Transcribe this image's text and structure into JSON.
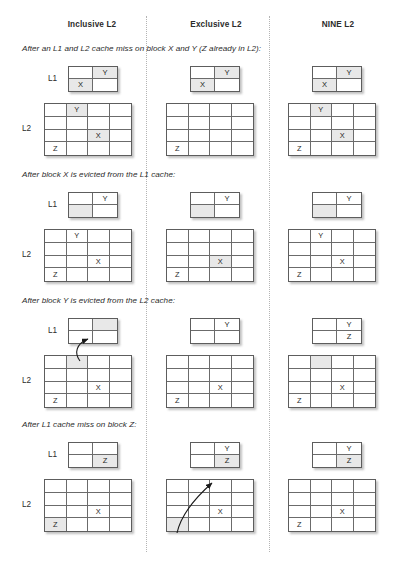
{
  "diagram": {
    "columns": [
      {
        "id": "inclusive",
        "label": "Inclusive L2"
      },
      {
        "id": "exclusive",
        "label": "Exclusive L2"
      },
      {
        "id": "nine",
        "label": "NINE L2"
      }
    ],
    "row_labels": {
      "l1": "L1",
      "l2": "L2"
    },
    "block_names": {
      "x": "X",
      "y": "Y",
      "z": "Z"
    },
    "shade_color": "#e8e8e8",
    "border_color": "#5d5d5d",
    "sections": [
      {
        "id": "section-1",
        "caption": "After an L1 and L2 cache miss on block X and Y (Z already in L2):",
        "cells": {
          "inclusive": {
            "l1": [
              [
                "",
                "Y"
              ],
              [
                "X",
                ""
              ]
            ],
            "l1_shaded": [
              [
                false,
                true
              ],
              [
                true,
                false
              ]
            ],
            "l2": [
              [
                "",
                "Y",
                "",
                ""
              ],
              [
                "",
                "",
                "",
                ""
              ],
              [
                "",
                "",
                "X",
                ""
              ],
              [
                "Z",
                "",
                "",
                ""
              ]
            ],
            "l2_shaded": [
              [
                false,
                true,
                false,
                false
              ],
              [
                false,
                false,
                false,
                false
              ],
              [
                false,
                false,
                true,
                false
              ],
              [
                false,
                false,
                false,
                false
              ]
            ]
          },
          "exclusive": {
            "l1": [
              [
                "",
                "Y"
              ],
              [
                "X",
                ""
              ]
            ],
            "l1_shaded": [
              [
                false,
                true
              ],
              [
                true,
                false
              ]
            ],
            "l2": [
              [
                "",
                "",
                "",
                ""
              ],
              [
                "",
                "",
                "",
                ""
              ],
              [
                "",
                "",
                "",
                ""
              ],
              [
                "Z",
                "",
                "",
                ""
              ]
            ],
            "l2_shaded": [
              [
                false,
                false,
                false,
                false
              ],
              [
                false,
                false,
                false,
                false
              ],
              [
                false,
                false,
                false,
                false
              ],
              [
                false,
                false,
                false,
                false
              ]
            ]
          },
          "nine": {
            "l1": [
              [
                "",
                "Y"
              ],
              [
                "X",
                ""
              ]
            ],
            "l1_shaded": [
              [
                false,
                true
              ],
              [
                true,
                false
              ]
            ],
            "l2": [
              [
                "",
                "Y",
                "",
                ""
              ],
              [
                "",
                "",
                "",
                ""
              ],
              [
                "",
                "",
                "X",
                ""
              ],
              [
                "Z",
                "",
                "",
                ""
              ]
            ],
            "l2_shaded": [
              [
                false,
                true,
                false,
                false
              ],
              [
                false,
                false,
                false,
                false
              ],
              [
                false,
                false,
                true,
                false
              ],
              [
                false,
                false,
                false,
                false
              ]
            ]
          }
        },
        "arrows": []
      },
      {
        "id": "section-2",
        "caption": "After block X is evicted from the L1 cache:",
        "cells": {
          "inclusive": {
            "l1": [
              [
                "",
                "Y"
              ],
              [
                "",
                ""
              ]
            ],
            "l1_shaded": [
              [
                false,
                false
              ],
              [
                true,
                false
              ]
            ],
            "l2": [
              [
                "",
                "Y",
                "",
                ""
              ],
              [
                "",
                "",
                "",
                ""
              ],
              [
                "",
                "",
                "X",
                ""
              ],
              [
                "Z",
                "",
                "",
                ""
              ]
            ],
            "l2_shaded": [
              [
                false,
                false,
                false,
                false
              ],
              [
                false,
                false,
                false,
                false
              ],
              [
                false,
                false,
                false,
                false
              ],
              [
                false,
                false,
                false,
                false
              ]
            ]
          },
          "exclusive": {
            "l1": [
              [
                "",
                "Y"
              ],
              [
                "",
                ""
              ]
            ],
            "l1_shaded": [
              [
                false,
                false
              ],
              [
                true,
                false
              ]
            ],
            "l2": [
              [
                "",
                "",
                "",
                ""
              ],
              [
                "",
                "",
                "",
                ""
              ],
              [
                "",
                "",
                "X",
                ""
              ],
              [
                "Z",
                "",
                "",
                ""
              ]
            ],
            "l2_shaded": [
              [
                false,
                false,
                false,
                false
              ],
              [
                false,
                false,
                false,
                false
              ],
              [
                false,
                false,
                true,
                false
              ],
              [
                false,
                false,
                false,
                false
              ]
            ]
          },
          "nine": {
            "l1": [
              [
                "",
                "Y"
              ],
              [
                "",
                ""
              ]
            ],
            "l1_shaded": [
              [
                false,
                false
              ],
              [
                true,
                false
              ]
            ],
            "l2": [
              [
                "",
                "Y",
                "",
                ""
              ],
              [
                "",
                "",
                "",
                ""
              ],
              [
                "",
                "",
                "X",
                ""
              ],
              [
                "Z",
                "",
                "",
                ""
              ]
            ],
            "l2_shaded": [
              [
                false,
                false,
                false,
                false
              ],
              [
                false,
                false,
                false,
                false
              ],
              [
                false,
                false,
                false,
                false
              ],
              [
                false,
                false,
                false,
                false
              ]
            ]
          }
        },
        "arrows": []
      },
      {
        "id": "section-3",
        "caption": "After block Y is evicted from the L2 cache:",
        "cells": {
          "inclusive": {
            "l1": [
              [
                "",
                ""
              ],
              [
                "",
                ""
              ]
            ],
            "l1_shaded": [
              [
                false,
                true
              ],
              [
                false,
                false
              ]
            ],
            "l2": [
              [
                "",
                "",
                "",
                ""
              ],
              [
                "",
                "",
                "",
                ""
              ],
              [
                "",
                "",
                "X",
                ""
              ],
              [
                "Z",
                "",
                "",
                ""
              ]
            ],
            "l2_shaded": [
              [
                false,
                true,
                false,
                false
              ],
              [
                false,
                false,
                false,
                false
              ],
              [
                false,
                false,
                false,
                false
              ],
              [
                false,
                false,
                false,
                false
              ]
            ]
          },
          "exclusive": {
            "l1": [
              [
                "",
                "Y"
              ],
              [
                "",
                ""
              ]
            ],
            "l1_shaded": [
              [
                false,
                false
              ],
              [
                false,
                false
              ]
            ],
            "l2": [
              [
                "",
                "",
                "",
                ""
              ],
              [
                "",
                "",
                "",
                ""
              ],
              [
                "",
                "",
                "X",
                ""
              ],
              [
                "Z",
                "",
                "",
                ""
              ]
            ],
            "l2_shaded": [
              [
                false,
                false,
                false,
                false
              ],
              [
                false,
                false,
                false,
                false
              ],
              [
                false,
                false,
                false,
                false
              ],
              [
                false,
                false,
                false,
                false
              ]
            ]
          },
          "nine": {
            "l1": [
              [
                "",
                "Y"
              ],
              [
                "",
                "Z"
              ]
            ],
            "l1_shaded": [
              [
                false,
                false
              ],
              [
                false,
                false
              ]
            ],
            "l2": [
              [
                "",
                "",
                "",
                ""
              ],
              [
                "",
                "",
                "",
                ""
              ],
              [
                "",
                "",
                "X",
                ""
              ],
              [
                "Z",
                "",
                "",
                ""
              ]
            ],
            "l2_shaded": [
              [
                false,
                true,
                false,
                false
              ],
              [
                false,
                false,
                false,
                false
              ],
              [
                false,
                false,
                false,
                false
              ],
              [
                false,
                false,
                false,
                false
              ]
            ]
          }
        },
        "arrows": [
          "inclusive-l2-to-l1"
        ]
      },
      {
        "id": "section-4",
        "caption": "After L1 cache miss on block Z:",
        "cells": {
          "inclusive": {
            "l1": [
              [
                "",
                ""
              ],
              [
                "",
                "Z"
              ]
            ],
            "l1_shaded": [
              [
                false,
                false
              ],
              [
                false,
                true
              ]
            ],
            "l2": [
              [
                "",
                "",
                "",
                ""
              ],
              [
                "",
                "",
                "",
                ""
              ],
              [
                "",
                "",
                "X",
                ""
              ],
              [
                "Z",
                "",
                "",
                ""
              ]
            ],
            "l2_shaded": [
              [
                false,
                false,
                false,
                false
              ],
              [
                false,
                false,
                false,
                false
              ],
              [
                false,
                false,
                false,
                false
              ],
              [
                true,
                false,
                false,
                false
              ]
            ]
          },
          "exclusive": {
            "l1": [
              [
                "",
                "Y"
              ],
              [
                "",
                "Z"
              ]
            ],
            "l1_shaded": [
              [
                false,
                false
              ],
              [
                false,
                true
              ]
            ],
            "l2": [
              [
                "",
                "",
                "",
                ""
              ],
              [
                "",
                "",
                "",
                ""
              ],
              [
                "",
                "",
                "X",
                ""
              ],
              [
                "",
                "",
                "",
                ""
              ]
            ],
            "l2_shaded": [
              [
                false,
                false,
                false,
                false
              ],
              [
                false,
                false,
                false,
                false
              ],
              [
                false,
                false,
                false,
                false
              ],
              [
                true,
                false,
                false,
                false
              ]
            ]
          },
          "nine": {
            "l1": [
              [
                "",
                "Y"
              ],
              [
                "",
                "Z"
              ]
            ],
            "l1_shaded": [
              [
                false,
                false
              ],
              [
                false,
                true
              ]
            ],
            "l2": [
              [
                "",
                "",
                "",
                ""
              ],
              [
                "",
                "",
                "",
                ""
              ],
              [
                "",
                "",
                "X",
                ""
              ],
              [
                "Z",
                "",
                "",
                ""
              ]
            ],
            "l2_shaded": [
              [
                false,
                false,
                false,
                false
              ],
              [
                false,
                false,
                false,
                false
              ],
              [
                false,
                false,
                false,
                false
              ],
              [
                false,
                false,
                false,
                false
              ]
            ]
          }
        },
        "arrows": [
          "exclusive-l2-to-l1"
        ]
      }
    ]
  }
}
